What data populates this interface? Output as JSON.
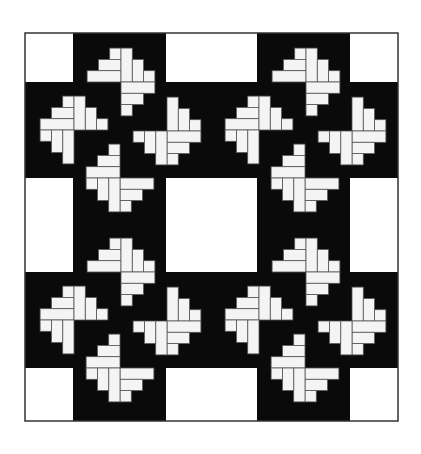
{
  "figure": {
    "title": "Pinwheel log-cabin quilt pattern",
    "layout": "2x2 blocks, each a black plus-shaped field with four white staircase pinwheel motifs",
    "colors": {
      "background": "#ffffff",
      "field": "#0a0a0a",
      "motif": "#f4f4f4",
      "frame": "#333333",
      "seam": "#555555"
    },
    "frame": {
      "x": 25,
      "y": 33,
      "w": 373,
      "h": 388
    },
    "white_columns": [
      [
        25,
        73
      ],
      [
        166,
        257
      ],
      [
        350,
        398
      ]
    ],
    "white_rows": [
      [
        33,
        82
      ],
      [
        178,
        272
      ],
      [
        368,
        421
      ]
    ],
    "unit": 11.3,
    "block_offsets": [
      [
        0,
        0
      ],
      [
        185,
        0
      ],
      [
        0,
        190
      ],
      [
        185,
        190
      ]
    ],
    "motifs": [
      {
        "name": "top",
        "cx": 121,
        "cy": 82,
        "quadrants": [
          "TL",
          "TR",
          "BR"
        ]
      },
      {
        "name": "left",
        "cx": 74,
        "cy": 130,
        "quadrants": [
          "TL",
          "TR",
          "BL"
        ]
      },
      {
        "name": "right",
        "cx": 167,
        "cy": 131,
        "quadrants": [
          "TR",
          "BR",
          "BL"
        ]
      },
      {
        "name": "bottom",
        "cx": 120,
        "cy": 178,
        "quadrants": [
          "TL",
          "BR",
          "BL"
        ]
      }
    ]
  }
}
